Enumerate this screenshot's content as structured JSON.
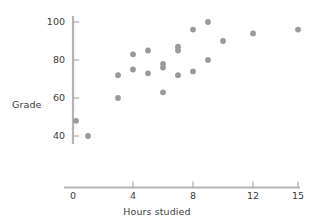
{
  "chart_data": {
    "type": "scatter",
    "title": "",
    "xlabel": "Hours studied",
    "ylabel": "Grade",
    "xlim": [
      0,
      15.6
    ],
    "ylim": [
      36,
      103
    ],
    "xticks": [
      0,
      4,
      8,
      12,
      15
    ],
    "yticks": [
      40,
      60,
      80,
      100
    ],
    "xtick_labels": [
      "0",
      "4",
      "8",
      "12",
      "15"
    ],
    "ytick_labels": [
      "40",
      "60",
      "80",
      "100"
    ],
    "grid": false,
    "legend": false,
    "marker_color": "#9a9a9a",
    "axis_color": "#b4b4b4",
    "points": [
      {
        "x": 0.2,
        "y": 48
      },
      {
        "x": 1.0,
        "y": 40
      },
      {
        "x": 3.0,
        "y": 72
      },
      {
        "x": 3.0,
        "y": 60
      },
      {
        "x": 4.0,
        "y": 83
      },
      {
        "x": 4.0,
        "y": 75
      },
      {
        "x": 5.0,
        "y": 85
      },
      {
        "x": 5.0,
        "y": 73
      },
      {
        "x": 6.0,
        "y": 78
      },
      {
        "x": 6.0,
        "y": 76
      },
      {
        "x": 6.0,
        "y": 63
      },
      {
        "x": 7.0,
        "y": 87
      },
      {
        "x": 7.0,
        "y": 85
      },
      {
        "x": 7.0,
        "y": 72
      },
      {
        "x": 8.0,
        "y": 96
      },
      {
        "x": 8.0,
        "y": 74
      },
      {
        "x": 9.0,
        "y": 100
      },
      {
        "x": 9.0,
        "y": 80
      },
      {
        "x": 10.0,
        "y": 90
      },
      {
        "x": 12.0,
        "y": 94
      },
      {
        "x": 15.0,
        "y": 96
      }
    ]
  },
  "axes": {
    "y_title": "Grade",
    "x_title": "Hours studied"
  }
}
